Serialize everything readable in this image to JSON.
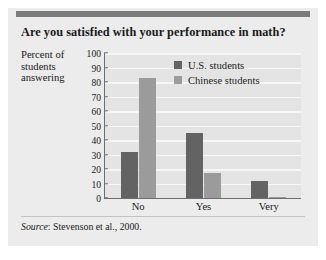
{
  "figure": {
    "title": "Are you satisfied with your performance in math?",
    "axis_caption": "Percent of students answering",
    "source": {
      "label": "Source",
      "text": ": Stevenson et al., 2000."
    }
  },
  "colors": {
    "panel_background": "#ececed",
    "plot_background": "#e4e4e5",
    "gridline": "#f7f7f7",
    "axis": "#6e6e6e",
    "top_rule": "#7b7b7b",
    "us_students": "#636363",
    "chinese_students": "#9b9b9b",
    "text": "#1a1a1a"
  },
  "chart_data": {
    "type": "bar",
    "title": "Are you satisfied with your performance in math?",
    "xlabel": "",
    "ylabel": "Percent of students answering",
    "ylim": [
      0,
      100
    ],
    "yticks": [
      0,
      10,
      20,
      30,
      40,
      50,
      60,
      70,
      80,
      90,
      100
    ],
    "ytick_labels": [
      "0",
      "10",
      "20",
      "30",
      "40",
      "50",
      "60",
      "70",
      "80",
      "90",
      "100"
    ],
    "grid": true,
    "legend_position": "upper right",
    "categories": [
      "No",
      "Yes",
      "Very"
    ],
    "series": [
      {
        "name": "U.S. students",
        "color": "#636363",
        "values": [
          32,
          45,
          12
        ]
      },
      {
        "name": "Chinese students",
        "color": "#9b9b9b",
        "values": [
          83,
          17,
          1
        ]
      }
    ],
    "annotations": [
      "Source: Stevenson et al., 2000."
    ]
  }
}
